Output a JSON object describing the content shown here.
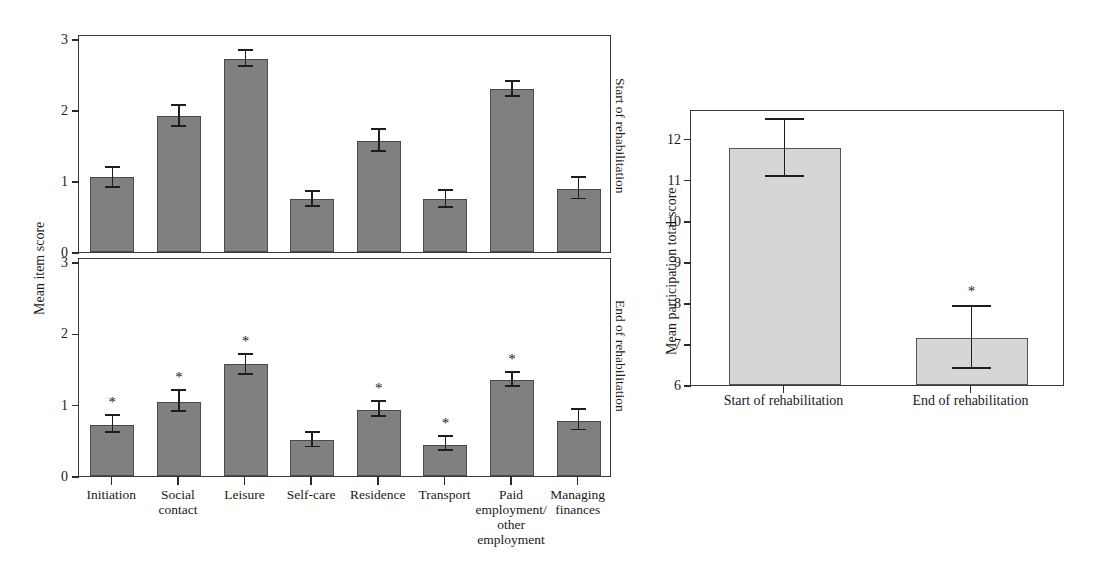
{
  "chart_data": [
    {
      "type": "bar",
      "id": "mean-item-score-start",
      "title": "",
      "panel_label": "Start of rehabilitation",
      "xlabel": "",
      "ylabel": "Mean item score",
      "ylim": [
        0,
        3.07
      ],
      "yticks": [
        0,
        1,
        2,
        3
      ],
      "ytick_labels": [
        "0",
        "1",
        "2",
        "3"
      ],
      "grid": false,
      "legend": "none",
      "bar_color": "#808080",
      "categories": [
        "Initiation",
        "Social contact",
        "Leisure",
        "Self-care",
        "Residence",
        "Transport",
        "Paid employment/ other employment",
        "Managing finances"
      ],
      "values": [
        1.05,
        1.92,
        2.72,
        0.74,
        1.56,
        0.74,
        2.29,
        0.89
      ],
      "error_low": [
        0.9,
        1.76,
        2.61,
        0.63,
        1.41,
        0.62,
        2.18,
        0.74
      ],
      "error_high": [
        1.19,
        2.06,
        2.83,
        0.85,
        1.72,
        0.86,
        2.4,
        1.04
      ],
      "significance": [
        "",
        "",
        "",
        "",
        "",
        "",
        "",
        ""
      ]
    },
    {
      "type": "bar",
      "id": "mean-item-score-end",
      "title": "",
      "panel_label": "End of rehabilitation",
      "xlabel": "",
      "ylabel": "Mean item score",
      "ylim": [
        0,
        3.07
      ],
      "yticks": [
        0,
        1,
        2,
        3
      ],
      "ytick_labels": [
        "0",
        "1",
        "2",
        "3"
      ],
      "grid": false,
      "legend": "none",
      "bar_color": "#808080",
      "categories": [
        "Initiation",
        "Social contact",
        "Leisure",
        "Self-care",
        "Residence",
        "Transport",
        "Paid employment/ other employment",
        "Managing finances"
      ],
      "values": [
        0.72,
        1.04,
        1.57,
        0.5,
        0.93,
        0.44,
        1.35,
        0.77
      ],
      "error_low": [
        0.61,
        0.9,
        1.42,
        0.4,
        0.83,
        0.35,
        1.25,
        0.64
      ],
      "error_high": [
        0.84,
        1.19,
        1.7,
        0.61,
        1.04,
        0.55,
        1.45,
        0.93
      ],
      "significance": [
        "*",
        "*",
        "*",
        "",
        "*",
        "*",
        "*",
        ""
      ]
    },
    {
      "type": "bar",
      "id": "mean-participation-total-score",
      "title": "",
      "xlabel": "",
      "ylabel": "Mean participation total score",
      "ylim": [
        6,
        12.72
      ],
      "yticks": [
        6,
        7,
        8,
        9,
        10,
        11,
        12
      ],
      "ytick_labels": [
        "6",
        "7",
        "8",
        "9",
        "10",
        "11",
        "12"
      ],
      "grid": false,
      "legend": "none",
      "bar_color": "#d6d6d6",
      "categories": [
        "Start of rehabilitation",
        "End of rehabilitation"
      ],
      "values": [
        11.78,
        7.15
      ],
      "error_low": [
        11.07,
        6.4
      ],
      "error_high": [
        12.46,
        7.9
      ],
      "significance": [
        "",
        "*"
      ]
    }
  ],
  "left_figure": {
    "ylabel": "Mean item score",
    "panels": [
      {
        "side_label": "Start of rehabilitation"
      },
      {
        "side_label": "End of rehabilitation"
      }
    ],
    "categories": [
      {
        "lines": [
          "Initiation"
        ]
      },
      {
        "lines": [
          "Social",
          "contact"
        ]
      },
      {
        "lines": [
          "Leisure"
        ]
      },
      {
        "lines": [
          "Self-care"
        ]
      },
      {
        "lines": [
          "Residence"
        ]
      },
      {
        "lines": [
          "Transport"
        ]
      },
      {
        "lines": [
          "Paid",
          "employment/",
          "other",
          "employment"
        ]
      },
      {
        "lines": [
          "Managing",
          "finances"
        ]
      }
    ]
  },
  "right_figure": {
    "ylabel": "Mean participation total score",
    "categories": [
      "Start of rehabilitation",
      "End of rehabilitation"
    ]
  },
  "colors": {
    "bar_dark": "#808080",
    "bar_light": "#d6d6d6",
    "axis": "#3a3a3a",
    "text": "#1a1a1a"
  }
}
